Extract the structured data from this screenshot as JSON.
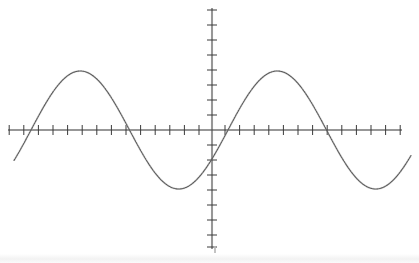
{
  "figure": {
    "title": "",
    "background_color": "#ffffff",
    "ink_color": "#4a4a4a",
    "curve_color": "#5a5a5a",
    "render_style": "scanned-dotted"
  },
  "axes": {
    "origin_px": {
      "x": 212,
      "y": 130
    },
    "x_axis": {
      "label": "",
      "start_px": 8,
      "end_px": 402,
      "tick_spacing_px": 14.6,
      "tick_half_length_px": 5,
      "tick_count_left": 14,
      "tick_count_right": 13,
      "arrowheads": false
    },
    "y_axis": {
      "label": "",
      "start_px": 8,
      "end_px": 249,
      "tick_spacing_px": 15,
      "tick_half_length_px": 5,
      "tick_count_up": 8,
      "tick_count_down": 8,
      "arrowheads": false
    }
  },
  "chart_data": {
    "type": "line",
    "title": "",
    "subtitle": "",
    "xlabel": "",
    "ylabel": "",
    "grid": false,
    "legend": null,
    "legend_position": "none",
    "annotations": [],
    "xtick_labels": [],
    "ytick_labels": [],
    "xlim": [
      -14,
      13
    ],
    "ylim": [
      -8,
      8
    ],
    "curve_description": "sine wave, y = A*sin(2*pi*(x - x0)/T)",
    "amplitude_units": 3.93,
    "period_units": 13.5,
    "phase_zero_crossing_units": -12.4,
    "amplitude_px": 59,
    "period_px": 197,
    "phase_px": 31,
    "visible_x_range_px": [
      14,
      411
    ],
    "peaks_px": [
      {
        "x": 62,
        "y": 71
      },
      {
        "x": 259,
        "y": 71
      }
    ],
    "troughs_px": [
      {
        "x": 161,
        "y": 189
      },
      {
        "x": 358,
        "y": 189
      }
    ],
    "zero_crossings_px": [
      31,
      113,
      212,
      310,
      409
    ],
    "series": [
      {
        "name": "sine",
        "x": [
          -14.0,
          -13.5,
          -13.0,
          -12.5,
          -12.0,
          -11.5,
          -11.0,
          -10.5,
          -10.0,
          -9.5,
          -9.0,
          -8.5,
          -8.0,
          -7.5,
          -7.0,
          -6.5,
          -6.0,
          -5.5,
          -5.0,
          -4.5,
          -4.0,
          -3.5,
          -3.0,
          -2.5,
          -2.0,
          -1.5,
          -1.0,
          -0.5,
          0.0,
          0.5,
          1.0,
          1.5,
          2.0,
          2.5,
          3.0,
          3.5,
          4.0,
          4.5,
          5.0,
          5.5,
          6.0,
          6.5,
          7.0,
          7.5,
          8.0,
          8.5,
          9.0,
          9.5,
          10.0,
          10.5,
          11.0,
          11.5,
          12.0,
          12.5,
          13.0
        ],
        "y": [
          -3.45,
          -2.94,
          -2.33,
          -1.64,
          -0.9,
          -0.13,
          0.64,
          1.39,
          2.08,
          2.7,
          3.22,
          3.63,
          3.88,
          3.93,
          3.85,
          3.61,
          3.22,
          2.71,
          2.09,
          1.4,
          0.66,
          -0.11,
          -0.88,
          -1.62,
          -2.31,
          -2.92,
          -3.45,
          -3.75,
          -3.93,
          -3.86,
          -3.65,
          -3.27,
          -2.76,
          -2.15,
          -1.47,
          -0.74,
          0.03,
          0.8,
          1.55,
          2.25,
          2.86,
          3.36,
          3.73,
          3.89,
          3.93,
          3.8,
          3.51,
          3.07,
          2.51,
          1.85,
          1.12,
          0.36,
          -0.41,
          -1.17,
          -1.89
        ]
      }
    ]
  }
}
